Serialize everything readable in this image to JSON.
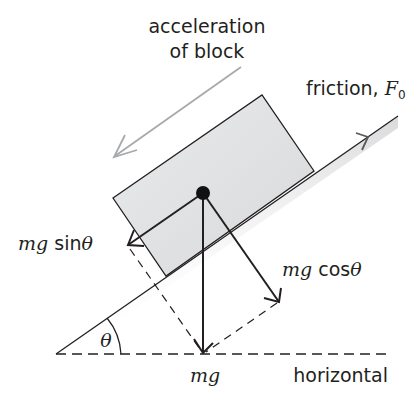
{
  "diagram": {
    "type": "inclined-plane-free-body",
    "labels": {
      "acceleration_line1": "acceleration",
      "acceleration_line2": "of block",
      "friction": "friction, ",
      "friction_symbol": "F",
      "friction_subscript": "0",
      "mg_sin_prefix": "mg",
      "mg_sin_func": " sin",
      "mg_sin_theta": "θ",
      "mg_cos_prefix": "mg",
      "mg_cos_func": " cos",
      "mg_cos_theta": "θ",
      "mg": "mg",
      "theta": "θ",
      "horizontal": "horizontal"
    },
    "colors": {
      "line": "#231f20",
      "acceleration_arrow": "#a7a9ac",
      "block_fill": "#e6e7e8",
      "slope_shade": "#d1d3d4"
    }
  }
}
